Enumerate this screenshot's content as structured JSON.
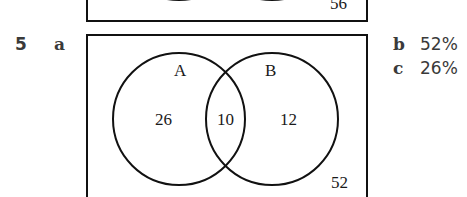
{
  "question": {
    "number": "5",
    "parts": {
      "a": "a",
      "b": "b",
      "c": "c"
    },
    "answers": {
      "b": "52%",
      "c": "26%"
    }
  },
  "previous_diagram": {
    "outside_value": "56"
  },
  "venn": {
    "set_a_label": "A",
    "set_b_label": "B",
    "only_a": "26",
    "a_and_b": "10",
    "only_b": "12",
    "outside": "52"
  },
  "colors": {
    "line": "#111111",
    "text": "#3a3a3a"
  }
}
